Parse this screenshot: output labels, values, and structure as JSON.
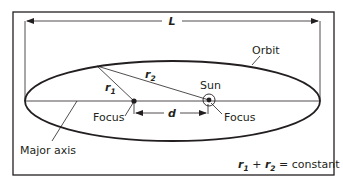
{
  "diagram": {
    "labels": {
      "length": "L",
      "orbit": "Orbit",
      "sun": "Sun",
      "focus_left": "Focus",
      "focus_right": "Focus",
      "distance": "d",
      "r1_base": "r",
      "r1_sub": "1",
      "r2_base": "r",
      "r2_sub": "2",
      "major_axis": "Major axis",
      "equation": {
        "r1": "r",
        "r1_sub": "1",
        "plus": " + ",
        "r2": "r",
        "r2_sub": "2",
        "rest": " = constant"
      }
    },
    "colors": {
      "stroke": "#231f20",
      "background": "#ffffff"
    }
  }
}
